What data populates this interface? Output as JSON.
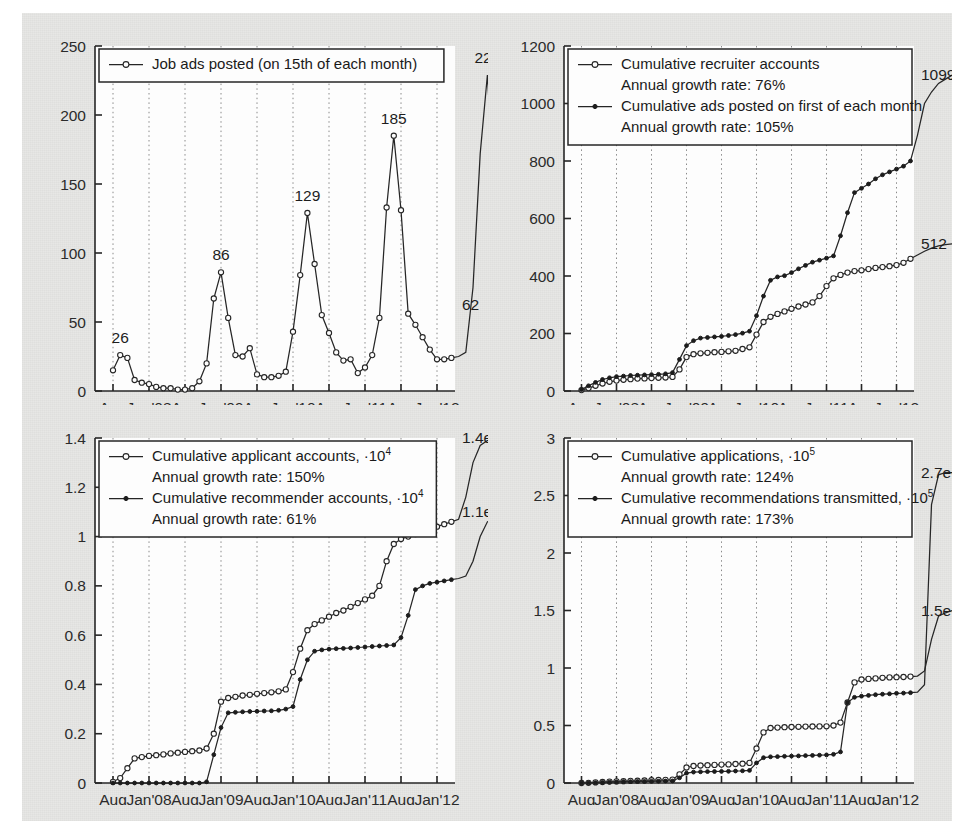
{
  "figure": {
    "background": "#e7e7e5",
    "panel_background": "#fdfdfd",
    "ink": "#262626"
  },
  "common": {
    "xtick_labels": [
      "Aug",
      "Jan'08",
      "Aug",
      "Jan'09",
      "Aug",
      "Jan'10",
      "Aug",
      "Jan'11",
      "Aug",
      "Jan'12"
    ]
  },
  "chart_data": [
    {
      "id": "job-ads-posted",
      "panel": "top-left",
      "type": "line",
      "title": "",
      "xlabel": "",
      "ylabel": "",
      "ylim": [
        0,
        250
      ],
      "yticks": [
        0,
        50,
        100,
        150,
        200,
        250
      ],
      "ytick_labels": [
        "0",
        "50",
        "100",
        "150",
        "200",
        "250"
      ],
      "grid": "vertical-dotted",
      "legend_position": "top-left",
      "legend": [
        {
          "label": "Job ads posted (on 15th of each month)",
          "marker": "open-circle"
        }
      ],
      "x": [
        "Aug'07",
        "Sep'07",
        "Oct'07",
        "Nov'07",
        "Dec'07",
        "Jan'08",
        "Feb'08",
        "Mar'08",
        "Apr'08",
        "May'08",
        "Jun'08",
        "Jul'08",
        "Aug'08",
        "Sep'08",
        "Oct'08",
        "Nov'08",
        "Dec'08",
        "Jan'09",
        "Feb'09",
        "Mar'09",
        "Apr'09",
        "May'09",
        "Jun'09",
        "Jul'09",
        "Aug'09",
        "Sep'09",
        "Oct'09",
        "Nov'09",
        "Dec'09",
        "Jan'10",
        "Feb'10",
        "Mar'10",
        "Apr'10",
        "May'10",
        "Jun'10",
        "Jul'10",
        "Aug'10",
        "Sep'10",
        "Oct'10",
        "Nov'10",
        "Dec'10",
        "Jan'11",
        "Feb'11",
        "Mar'11",
        "Apr'11",
        "May'11",
        "Jun'11",
        "Jul'11",
        "Aug'11",
        "Sep'11",
        "Oct'11",
        "Nov'11",
        "Dec'11",
        "Jan'12",
        "Feb'12",
        "Mar'12",
        "Apr'12",
        "May'12"
      ],
      "series": [
        {
          "name": "Job ads posted (on 15th of each month)",
          "marker": "open-circle",
          "values": [
            15,
            26,
            24,
            8,
            6,
            5,
            3,
            2,
            2,
            1,
            1,
            2,
            7,
            20,
            67,
            86,
            53,
            26,
            25,
            31,
            12,
            10,
            10,
            11,
            14,
            43,
            84,
            129,
            92,
            55,
            42,
            28,
            22,
            23,
            13,
            17,
            26,
            53,
            133,
            185,
            131,
            56,
            48,
            39,
            30,
            23,
            23,
            24,
            25,
            28,
            75,
            172,
            229,
            142,
            78,
            62
          ]
        }
      ],
      "annotations": [
        {
          "text": "26",
          "value": 26,
          "at": "Sep'07"
        },
        {
          "text": "86",
          "value": 86,
          "at": "Nov'08"
        },
        {
          "text": "129",
          "value": 129,
          "at": "Nov'09"
        },
        {
          "text": "185",
          "value": 185,
          "at": "Nov'10"
        },
        {
          "text": "229",
          "value": 229,
          "at": "Dec'11"
        },
        {
          "text": "62",
          "value": 62,
          "at": "May'12"
        }
      ]
    },
    {
      "id": "recruiters-and-ads",
      "panel": "top-right",
      "type": "line",
      "title": "",
      "xlabel": "",
      "ylabel": "",
      "ylim": [
        0,
        1200
      ],
      "yticks": [
        0,
        200,
        400,
        600,
        800,
        1000,
        1200
      ],
      "ytick_labels": [
        "0",
        "200",
        "400",
        "600",
        "800",
        "1000",
        "1200"
      ],
      "grid": "vertical-dotted",
      "legend_position": "top-left",
      "legend": [
        {
          "label": "Cumulative recruiter accounts",
          "sublabel": "Annual growth rate:  76%",
          "marker": "open-circle"
        },
        {
          "label": "Cumulative ads posted on first of each month",
          "sublabel": "Annual growth rate: 105%",
          "marker": "filled-circle"
        }
      ],
      "series": [
        {
          "name": "Cumulative recruiter accounts",
          "marker": "open-circle",
          "growth_rate": "76%",
          "end_label": "512",
          "values": [
            3,
            10,
            18,
            26,
            32,
            36,
            39,
            41,
            43,
            44,
            45,
            46,
            47,
            49,
            75,
            118,
            128,
            131,
            133,
            135,
            136,
            138,
            140,
            146,
            152,
            196,
            240,
            258,
            268,
            277,
            286,
            294,
            301,
            308,
            330,
            365,
            392,
            404,
            412,
            417,
            420,
            424,
            428,
            431,
            434,
            438,
            446,
            460,
            473,
            486,
            497,
            505,
            509,
            512
          ]
        },
        {
          "name": "Cumulative ads posted on first of each month",
          "marker": "filled-circle",
          "growth_rate": "105%",
          "end_label": "1099",
          "values": [
            5,
            18,
            30,
            40,
            46,
            50,
            52,
            54,
            55,
            56,
            57,
            58,
            60,
            64,
            110,
            158,
            175,
            184,
            186,
            188,
            190,
            193,
            196,
            201,
            208,
            262,
            330,
            385,
            397,
            401,
            412,
            425,
            437,
            448,
            455,
            462,
            470,
            540,
            620,
            690,
            705,
            720,
            738,
            752,
            762,
            772,
            782,
            800,
            890,
            1000,
            1040,
            1070,
            1085,
            1099
          ]
        }
      ],
      "annotations": [
        {
          "text": "1099",
          "series": "Cumulative ads posted on first of each month"
        },
        {
          "text": "512",
          "series": "Cumulative recruiter accounts"
        }
      ]
    },
    {
      "id": "applicants-and-recommenders",
      "panel": "bottom-left",
      "type": "line",
      "title": "",
      "xlabel": "",
      "ylabel": "",
      "ylim": [
        0,
        1.4
      ],
      "yticks": [
        0,
        0.2,
        0.4,
        0.6,
        0.8,
        1,
        1.2,
        1.4
      ],
      "ytick_labels": [
        "0",
        "0.2",
        "0.4",
        "0.6",
        "0.8",
        "1",
        "1.2",
        "1.4"
      ],
      "grid": "vertical-dotted",
      "legend_position": "top-left",
      "legend": [
        {
          "label": "Cumulative applicant accounts, ·10",
          "exponent": "4",
          "sublabel": "Annual growth rate: 150%",
          "marker": "open-circle"
        },
        {
          "label": "Cumulative recommender accounts, ·10",
          "exponent": "4",
          "sublabel": "Annual growth rate:  61%",
          "marker": "filled-circle"
        }
      ],
      "series": [
        {
          "name": "Cumulative applicant accounts, ·10^4",
          "marker": "open-circle",
          "growth_rate": "150%",
          "end_label": "1.4e+04",
          "values": [
            0.005,
            0.02,
            0.06,
            0.1,
            0.105,
            0.11,
            0.113,
            0.116,
            0.12,
            0.123,
            0.126,
            0.129,
            0.132,
            0.14,
            0.2,
            0.33,
            0.345,
            0.35,
            0.355,
            0.358,
            0.362,
            0.365,
            0.368,
            0.372,
            0.38,
            0.45,
            0.545,
            0.62,
            0.645,
            0.66,
            0.675,
            0.69,
            0.7,
            0.715,
            0.73,
            0.745,
            0.76,
            0.8,
            0.9,
            0.97,
            0.99,
            1.0,
            1.01,
            1.02,
            1.03,
            1.04,
            1.05,
            1.06,
            1.07,
            1.16,
            1.3,
            1.37,
            1.39,
            1.4
          ]
        },
        {
          "name": "Cumulative recommender accounts, ·10^4",
          "marker": "filled-circle",
          "growth_rate": "61%",
          "end_label": "1.1e+04",
          "values": [
            0,
            0,
            0,
            0,
            0,
            0,
            0,
            0,
            0,
            0,
            0,
            0,
            0,
            0.005,
            0.115,
            0.225,
            0.285,
            0.287,
            0.289,
            0.29,
            0.291,
            0.292,
            0.293,
            0.295,
            0.3,
            0.31,
            0.42,
            0.5,
            0.535,
            0.54,
            0.543,
            0.545,
            0.546,
            0.548,
            0.55,
            0.552,
            0.554,
            0.556,
            0.558,
            0.56,
            0.59,
            0.68,
            0.785,
            0.8,
            0.81,
            0.815,
            0.82,
            0.825,
            0.83,
            0.84,
            0.9,
            1.0,
            1.06,
            1.08,
            1.09,
            1.1
          ]
        }
      ],
      "annotations": [
        {
          "text": "1.4e+04",
          "series": "Cumulative applicant accounts"
        },
        {
          "text": "1.1e+04",
          "series": "Cumulative recommender accounts"
        }
      ]
    },
    {
      "id": "applications-and-recommendations",
      "panel": "bottom-right",
      "type": "line",
      "title": "",
      "xlabel": "",
      "ylabel": "",
      "ylim": [
        0,
        3
      ],
      "yticks": [
        0,
        0.5,
        1,
        1.5,
        2,
        2.5,
        3
      ],
      "ytick_labels": [
        "0",
        "0.5",
        "1",
        "1.5",
        "2",
        "2.5",
        "3"
      ],
      "grid": "vertical-dotted",
      "legend_position": "top-left",
      "legend": [
        {
          "label": "Cumulative applications, ·10",
          "exponent": "5",
          "sublabel": "Annual growth rate: 124%",
          "marker": "open-circle"
        },
        {
          "label": "Cumulative recommendations transmitted, ·10",
          "exponent": "5",
          "sublabel": "Annual growth rate: 173%",
          "marker": "filled-circle"
        }
      ],
      "series": [
        {
          "name": "Cumulative applications, ·10^5",
          "marker": "open-circle",
          "growth_rate": "124%",
          "end_label": "1.5e+05",
          "values": [
            0,
            0.002,
            0.005,
            0.009,
            0.012,
            0.014,
            0.016,
            0.018,
            0.02,
            0.022,
            0.024,
            0.026,
            0.028,
            0.03,
            0.075,
            0.135,
            0.148,
            0.152,
            0.155,
            0.157,
            0.16,
            0.162,
            0.165,
            0.168,
            0.175,
            0.3,
            0.44,
            0.478,
            0.482,
            0.485,
            0.487,
            0.489,
            0.49,
            0.491,
            0.492,
            0.493,
            0.5,
            0.525,
            0.7,
            0.875,
            0.9,
            0.905,
            0.91,
            0.915,
            0.918,
            0.92,
            0.922,
            0.925,
            0.93,
            0.975,
            1.25,
            1.45,
            1.48,
            1.5
          ]
        },
        {
          "name": "Cumulative recommendations transmitted, ·10^5",
          "marker": "filled-circle",
          "growth_rate": "173%",
          "end_label": "2.7e+05",
          "values": [
            0,
            0.001,
            0.003,
            0.005,
            0.007,
            0.009,
            0.011,
            0.012,
            0.013,
            0.014,
            0.015,
            0.016,
            0.017,
            0.018,
            0.045,
            0.085,
            0.095,
            0.097,
            0.099,
            0.1,
            0.101,
            0.102,
            0.104,
            0.106,
            0.11,
            0.175,
            0.22,
            0.228,
            0.23,
            0.232,
            0.234,
            0.236,
            0.238,
            0.24,
            0.242,
            0.244,
            0.25,
            0.27,
            0.7,
            0.745,
            0.755,
            0.762,
            0.768,
            0.772,
            0.776,
            0.78,
            0.782,
            0.785,
            0.79,
            0.855,
            2.42,
            2.68,
            2.7,
            2.7
          ]
        }
      ],
      "annotations": [
        {
          "text": "2.7e+05",
          "series": "Cumulative recommendations transmitted"
        },
        {
          "text": "1.5e+05",
          "series": "Cumulative applications"
        }
      ]
    }
  ]
}
